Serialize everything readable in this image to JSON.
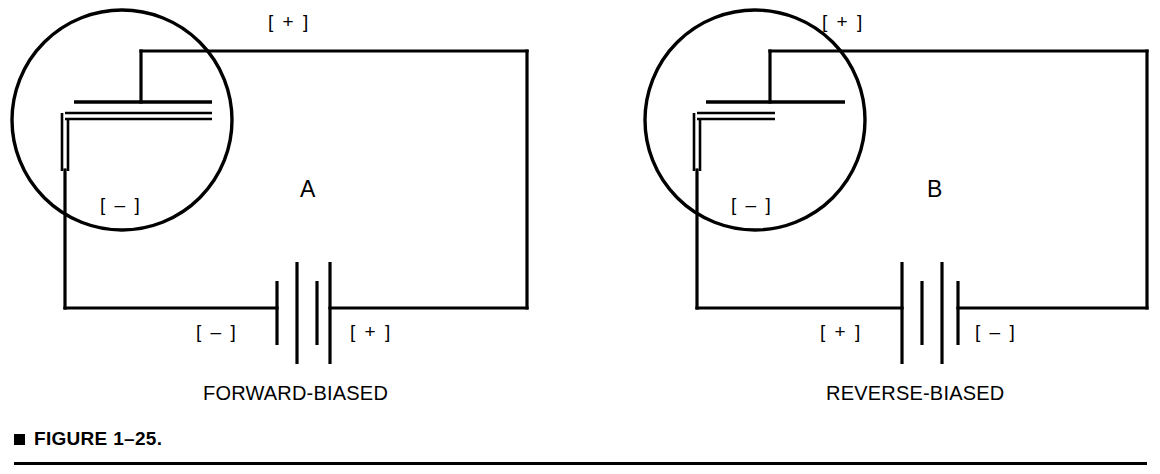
{
  "figure": {
    "caption_bullet": "square-bullet",
    "caption_text": "FIGURE 1–25."
  },
  "diagrams": [
    {
      "id": "A",
      "letter": "A",
      "bias_caption": "FORWARD-BIASED",
      "diode_top_polarity": "[ + ]",
      "diode_bottom_polarity": "[ – ]",
      "battery_left_polarity": "[ – ]",
      "battery_right_polarity": "[ + ]",
      "depletion_region": "narrow",
      "battery_bar_order": "short-tall-short-tall"
    },
    {
      "id": "B",
      "letter": "B",
      "bias_caption": "REVERSE-BIASED",
      "diode_top_polarity": "[ + ]",
      "diode_bottom_polarity": "[ – ]",
      "battery_left_polarity": "[ + ]",
      "battery_right_polarity": "[ – ]",
      "depletion_region": "wide",
      "battery_bar_order": "tall-short-tall-short"
    }
  ],
  "colors": {
    "ink": "#000000",
    "background": "#ffffff"
  }
}
